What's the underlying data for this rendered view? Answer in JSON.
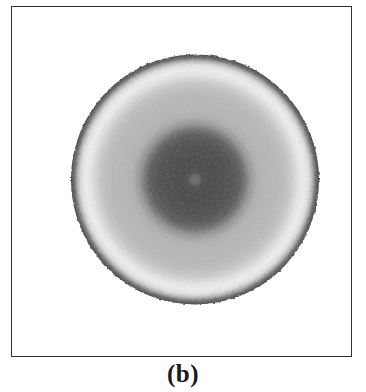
{
  "figure": {
    "caption": "(b)",
    "panel_label": "(b)",
    "background_color": "#ffffff",
    "frame_color": "#2e2e2e",
    "caption_color": "#1a1a1a"
  },
  "chart_data": {
    "type": "heatmap",
    "title": "(b)",
    "subtitle": "",
    "xlabel": "",
    "ylabel": "",
    "colormap": "grayscale",
    "symmetry": "radial",
    "legend": "none",
    "grid": false,
    "axes_visible": false,
    "annotations": [
      "(b)"
    ],
    "center_px": {
      "x": 183,
      "y": 172
    },
    "outer_radius_px": 125,
    "core_radius_px": 50,
    "bright_ring_radius_px": 95,
    "xlim": [
      -125,
      125
    ],
    "ylim": [
      -125,
      125
    ],
    "radial_profile": {
      "description": "Grayscale intensity as a function of normalized radius r (0 = center, 1 = outer disk edge). Value 0 = black, 255 = white.",
      "r": [
        0.0,
        0.04,
        0.1,
        0.18,
        0.28,
        0.36,
        0.4,
        0.44,
        0.5,
        0.56,
        0.62,
        0.68,
        0.72,
        0.76,
        0.8,
        0.84,
        0.88,
        0.92,
        0.95,
        0.97,
        1.0
      ],
      "gray": [
        112,
        86,
        80,
        80,
        84,
        96,
        118,
        150,
        176,
        182,
        184,
        186,
        190,
        198,
        212,
        228,
        236,
        222,
        176,
        120,
        74
      ],
      "rmax_label": "1.00",
      "gray_min": 74,
      "gray_max": 236
    },
    "features": [
      {
        "name": "central-speckle",
        "radius_norm": 0.02,
        "gray": 120,
        "note": "faint bright speckle at exact center"
      },
      {
        "name": "dark-core",
        "radius_norm_range": [
          0.05,
          0.36
        ],
        "gray": 82,
        "note": "broad dark central core"
      },
      {
        "name": "gray-plateau",
        "radius_norm_range": [
          0.5,
          0.74
        ],
        "gray": 182,
        "note": "mid light-gray annular plateau"
      },
      {
        "name": "bright-ring",
        "radius_norm_range": [
          0.8,
          0.9
        ],
        "gray": 234,
        "note": "brightest annulus"
      },
      {
        "name": "dark-rim",
        "radius_norm_range": [
          0.94,
          1.0
        ],
        "gray": 78,
        "note": "dark noisy speckled outer rim"
      }
    ]
  }
}
